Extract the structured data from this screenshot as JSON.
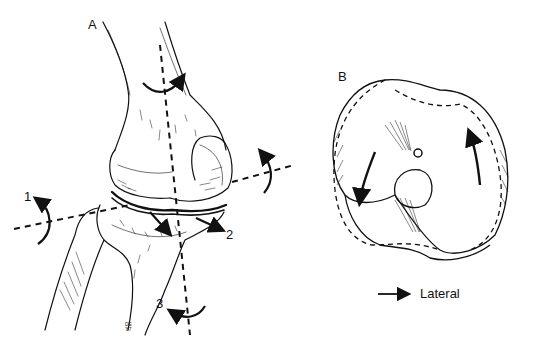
{
  "figure": {
    "panels": [
      {
        "id": "A",
        "label": "A",
        "description": "Knee joint, anterolateral view with rotation axes"
      },
      {
        "id": "B",
        "label": "B",
        "description": "Tibial plateau superior view with rotation arrows"
      }
    ],
    "axes": [
      {
        "id": "1",
        "label": "1"
      },
      {
        "id": "2",
        "label": "2"
      },
      {
        "id": "3",
        "label": "3"
      }
    ],
    "legend": {
      "arrow_icon": "right-arrow-icon",
      "label": "Lateral"
    },
    "signature": {
      "initials": "DE",
      "year": "'87"
    },
    "colors": {
      "ink": "#111111",
      "background": "#ffffff"
    }
  }
}
